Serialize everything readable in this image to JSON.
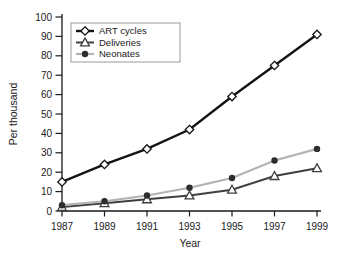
{
  "chart_data": {
    "type": "line",
    "title": "",
    "xlabel": "Year",
    "ylabel": "Per thousand",
    "x": [
      1987,
      1989,
      1991,
      1993,
      1995,
      1997,
      1999
    ],
    "xlim": [
      1987,
      1999
    ],
    "ylim": [
      0,
      100
    ],
    "ytick_step": 10,
    "grid": false,
    "legend": {
      "position": "top-left-inside",
      "border_color": "#9a9a9a",
      "background": "#ffffff",
      "entries": [
        "ART cycles",
        "Deliveries",
        "Neonates"
      ]
    },
    "series": [
      {
        "name": "ART cycles",
        "marker": "diamond-open",
        "color": "#141414",
        "marker_fill": "#ffffff",
        "line_width": 2.4,
        "values": [
          15,
          24,
          32,
          42,
          59,
          75,
          91
        ]
      },
      {
        "name": "Deliveries",
        "marker": "triangle-open",
        "color": "#3f3f3f",
        "marker_fill": "#ffffff",
        "line_width": 2.0,
        "values": [
          2,
          4,
          6,
          8,
          11,
          18,
          22
        ]
      },
      {
        "name": "Neonates",
        "marker": "circle-filled",
        "color": "#b3b3b3",
        "marker_fill": "#2d2d2d",
        "line_width": 2.2,
        "values": [
          3,
          5,
          8,
          12,
          17,
          26,
          32
        ]
      }
    ]
  }
}
